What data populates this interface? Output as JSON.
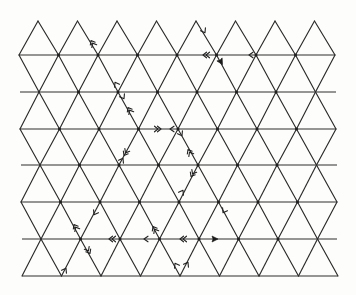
{
  "figure": {
    "colors": {
      "line": "#2a2a2a",
      "background": "#fdfdfb"
    },
    "lattice": {
      "rows_y": [
        21,
        55,
        92,
        129,
        165,
        202,
        239,
        276
      ],
      "row_x_start": [
        38,
        19,
        39,
        20,
        40,
        21,
        41,
        22
      ],
      "row_x_end": [
        315,
        335,
        316,
        336,
        317,
        337,
        318,
        338
      ],
      "spacing": 39.5,
      "horizontal_line_extents": [
        null,
        [
          19,
          335
        ],
        [
          20,
          336
        ],
        [
          20,
          336
        ],
        [
          21,
          337
        ],
        [
          21,
          337
        ],
        [
          22,
          337
        ],
        [
          22,
          338
        ]
      ]
    },
    "arrows": [
      {
        "x": 93,
        "y": 44,
        "angle": -120,
        "kind": "double"
      },
      {
        "x": 204,
        "y": 31,
        "angle": 60,
        "kind": "single"
      },
      {
        "x": 207,
        "y": 55,
        "angle": 180,
        "kind": "double"
      },
      {
        "x": 221,
        "y": 62,
        "angle": 60,
        "kind": "filled"
      },
      {
        "x": 251,
        "y": 55,
        "angle": 180,
        "kind": "single"
      },
      {
        "x": 116,
        "y": 84,
        "angle": -120,
        "kind": "single"
      },
      {
        "x": 123,
        "y": 97,
        "angle": 60,
        "kind": "single"
      },
      {
        "x": 130,
        "y": 111,
        "angle": -120,
        "kind": "double"
      },
      {
        "x": 157,
        "y": 129,
        "angle": 0,
        "kind": "double"
      },
      {
        "x": 172,
        "y": 129,
        "angle": 180,
        "kind": "single"
      },
      {
        "x": 181,
        "y": 134,
        "angle": 60,
        "kind": "single"
      },
      {
        "x": 190,
        "y": 153,
        "angle": -120,
        "kind": "double"
      },
      {
        "x": 126,
        "y": 152,
        "angle": 120,
        "kind": "double"
      },
      {
        "x": 122,
        "y": 160,
        "angle": -60,
        "kind": "single"
      },
      {
        "x": 193,
        "y": 173,
        "angle": 120,
        "kind": "double"
      },
      {
        "x": 182,
        "y": 192,
        "angle": -60,
        "kind": "single"
      },
      {
        "x": 224,
        "y": 211,
        "angle": 120,
        "kind": "single"
      },
      {
        "x": 95,
        "y": 213,
        "angle": 120,
        "kind": "single"
      },
      {
        "x": 76,
        "y": 228,
        "angle": -120,
        "kind": "double"
      },
      {
        "x": 113,
        "y": 239,
        "angle": 180,
        "kind": "double"
      },
      {
        "x": 146,
        "y": 239,
        "angle": 180,
        "kind": "single"
      },
      {
        "x": 155,
        "y": 230,
        "angle": -120,
        "kind": "double"
      },
      {
        "x": 184,
        "y": 239,
        "angle": 180,
        "kind": "double"
      },
      {
        "x": 215,
        "y": 239,
        "angle": 0,
        "kind": "filled"
      },
      {
        "x": 88,
        "y": 250,
        "angle": 60,
        "kind": "double"
      },
      {
        "x": 65,
        "y": 270,
        "angle": -60,
        "kind": "single"
      },
      {
        "x": 176,
        "y": 265,
        "angle": -120,
        "kind": "single"
      },
      {
        "x": 187,
        "y": 264,
        "angle": -60,
        "kind": "single"
      }
    ]
  }
}
